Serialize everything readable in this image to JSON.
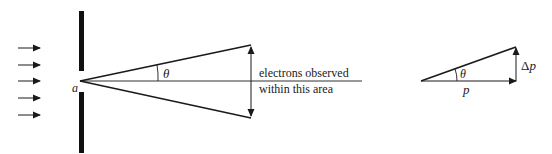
{
  "diagram": {
    "left_figure": {
      "incident_arrows_count": 5,
      "slit_label": "a",
      "angle_label": "θ",
      "observation_label_line1": "electrons observed",
      "observation_label_line2": "within this area"
    },
    "right_figure": {
      "angle_label": "θ",
      "horizontal_label": "p",
      "vertical_label": "Δp"
    },
    "colors": {
      "stroke": "#1a1a1a",
      "background": "#ffffff"
    }
  }
}
